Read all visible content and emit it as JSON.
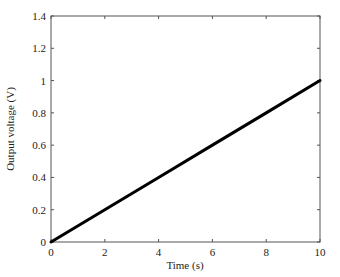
{
  "chart_data": {
    "type": "line",
    "title": "",
    "xlabel": "Time (s)",
    "ylabel": "Output voltage (V)",
    "xlim": [
      0,
      10
    ],
    "ylim": [
      0,
      1.4
    ],
    "xticks": [
      0,
      2,
      4,
      6,
      8,
      10
    ],
    "xtick_labels": [
      "0",
      "2",
      "4",
      "6",
      "8",
      "10"
    ],
    "yticks": [
      0,
      0.2,
      0.4,
      0.6,
      0.8,
      1.0,
      1.2,
      1.4
    ],
    "ytick_labels": [
      "0",
      "0.2",
      "0.4",
      "0.6",
      "0.8",
      "1",
      "1.2",
      "1.4"
    ],
    "grid": false,
    "legend": null,
    "series": [
      {
        "name": "Output voltage",
        "color": "#000000",
        "x": [
          0,
          2,
          4,
          6,
          8,
          10
        ],
        "y": [
          0,
          0.2,
          0.4,
          0.6,
          0.8,
          1.0
        ]
      }
    ]
  },
  "style": {
    "line_color": "#000000",
    "axis_color": "#555555",
    "background": "#ffffff"
  }
}
